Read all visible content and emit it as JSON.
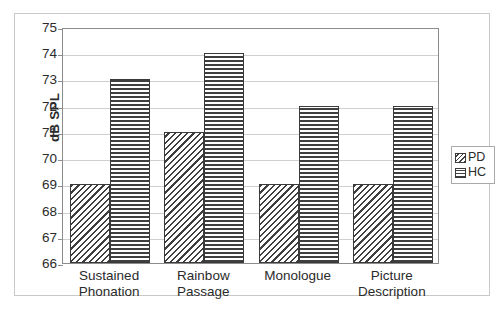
{
  "chart_data": {
    "type": "bar",
    "title": "",
    "subtitle": "",
    "xlabel": "",
    "ylabel": "dB SPL",
    "ylim": [
      66,
      75
    ],
    "ytick_step": 1,
    "yticks": [
      75,
      74,
      73,
      72,
      71,
      70,
      69,
      68,
      67,
      66
    ],
    "grid": true,
    "legend_position": "right",
    "categories": [
      "Sustained Phonation",
      "Rainbow Passage",
      "Monologue",
      "Picture Description"
    ],
    "category_lines": [
      [
        "Sustained",
        "Phonation"
      ],
      [
        "Rainbow",
        "Passage"
      ],
      [
        "Monologue",
        ""
      ],
      [
        "Picture",
        "Description"
      ]
    ],
    "series": [
      {
        "name": "PD",
        "pattern": "diagonal-hatch",
        "values": [
          69,
          71,
          69,
          69
        ]
      },
      {
        "name": "HC",
        "pattern": "horizontal-lines",
        "values": [
          73,
          74,
          72,
          72
        ]
      }
    ],
    "colors": {
      "pattern_stroke": "#3f3f3f",
      "bar_outline": "#3a3a3a",
      "gridline": "#cfcfcf",
      "axis": "#8c8c8c",
      "frame": "#c9c9c9",
      "text": "#2b2b2b"
    }
  },
  "legend": {
    "items": [
      {
        "label": "PD"
      },
      {
        "label": "HC"
      }
    ]
  }
}
